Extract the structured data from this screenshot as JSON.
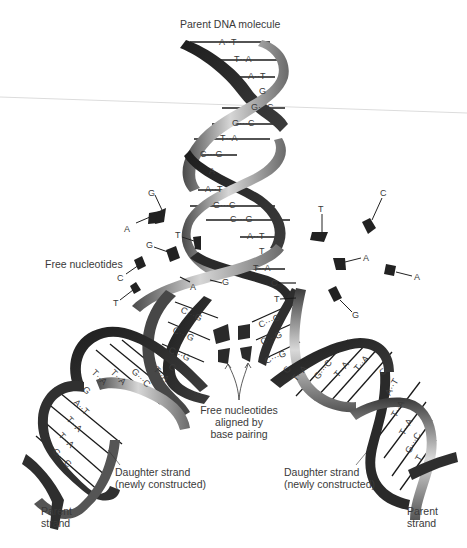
{
  "figure": {
    "title": "Parent DNA molecule",
    "colors": {
      "ribbon_dark": "#2b2b2b",
      "ribbon_mid": "#6e6e6e",
      "ribbon_light": "#d8d8d8",
      "text": "#3a3a3a",
      "nucleotide": "#222222",
      "background": "#ffffff",
      "guide_line": "#d9d9d9"
    }
  },
  "labels": {
    "parent_dna": "Parent DNA molecule",
    "free_nucleotides": "Free nucleotides",
    "aligned_line1": "Free nucleotides",
    "aligned_line2": "aligned by",
    "aligned_line3": "base pairing",
    "daughter_left_line1": "Daughter strand",
    "daughter_left_line2": "(newly constructed)",
    "daughter_right_line1": "Daughter strand",
    "daughter_right_line2": "(newly constructed)",
    "parent_left_line1": "Parent",
    "parent_left_line2": "strand",
    "parent_right_line1": "Parent",
    "parent_right_line2": "strand"
  },
  "parent_helix_pairs": [
    {
      "pair": "A··T"
    },
    {
      "pair": "T··A"
    },
    {
      "pair": "A··T"
    },
    {
      "pair": "G"
    },
    {
      "pair": "G···C"
    },
    {
      "pair": "G···C"
    },
    {
      "pair": "T··A"
    },
    {
      "pair": "C···G"
    },
    {
      "pair": "A"
    },
    {
      "pair": "A··T"
    },
    {
      "pair": "G···C"
    },
    {
      "pair": "C···G"
    },
    {
      "pair": "A··T"
    },
    {
      "pair": "T"
    },
    {
      "pair": "T··A"
    }
  ],
  "fork": {
    "left_unpaired": [
      "G",
      "A"
    ],
    "right_unpaired": [
      "C",
      "T"
    ],
    "left_new_pairs": [
      "C···G",
      "C···G",
      "C···G"
    ],
    "right_new_pairs": [
      "C···G",
      "C···G",
      "C···G"
    ]
  },
  "left_daughter_pairs": [
    "T··A",
    "T··A",
    "G···C",
    "T··A",
    "G",
    "A··T",
    "T··A",
    "T··A",
    "G···C",
    "C"
  ],
  "right_daughter_pairs": [
    "C",
    "T··A",
    "G···C",
    "T··A",
    "T··A",
    "C",
    "A··T",
    "T··A",
    "T··A",
    "G···C",
    "T"
  ],
  "free_nucleotides_left": [
    "A",
    "G",
    "T",
    "G",
    "C",
    "T"
  ],
  "free_nucleotides_right": [
    "T",
    "C",
    "A",
    "A",
    "G"
  ]
}
